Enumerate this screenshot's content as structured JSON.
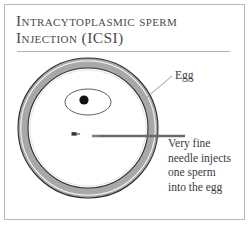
{
  "figure": {
    "title_line_1": "Intracytoplasmic sperm",
    "title_line_2": "Injection (ICSI)",
    "labels": {
      "egg": "Egg",
      "caption_line_1": "Very fine",
      "caption_line_2": "needle injects",
      "caption_line_3": "one sperm",
      "caption_line_4": "into the egg"
    },
    "colors": {
      "zona_fill": "#a8a8a8",
      "zona_outline": "#2e2e2e",
      "cytoplasm_fill": "#ffffff",
      "nucleus_dot": "#111111",
      "sperm_mark": "#333333",
      "needle": "#6a6a6a",
      "leader_line": "#8a8a8a",
      "frame": "#b9b9b9",
      "rule": "#b0b0b0",
      "text": "#3a3a3a",
      "title_text": "#4a4a4a",
      "background": "#ffffff"
    },
    "geometry": {
      "egg_center_x": 88,
      "egg_center_y": 128,
      "egg_outer_radius": 70,
      "egg_inner_radius": 60,
      "nucleus_ellipse_cx": 88,
      "nucleus_ellipse_cy": 102,
      "nucleus_ellipse_rx": 23,
      "nucleus_ellipse_ry": 13,
      "nucleus_dot_cx": 84,
      "nucleus_dot_cy": 100,
      "nucleus_dot_r": 4.5,
      "sperm_mark_x": 74,
      "sperm_mark_y": 134,
      "needle_start_x": 92,
      "needle_end_x": 185,
      "needle_y": 136
    }
  }
}
